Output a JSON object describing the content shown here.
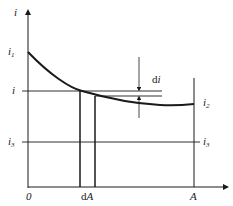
{
  "diagram": {
    "type": "line-diagram",
    "axes": {
      "y_label": "i",
      "x_label": "A",
      "origin_label": "0"
    },
    "labels": {
      "i1": {
        "base": "i",
        "sub": "1"
      },
      "i": "i",
      "i3_left": {
        "base": "i",
        "sub": "3"
      },
      "i3_right": {
        "base": "i",
        "sub": "3"
      },
      "i2": {
        "base": "i",
        "sub": "2"
      },
      "di": {
        "prefix": "d",
        "var": "i"
      },
      "dA": {
        "prefix": "d",
        "var": "A"
      },
      "A": "A"
    },
    "elements": [
      "decaying curve from i1 to i2",
      "horizontal line at i",
      "horizontal line at i3",
      "vertical strip of width dA",
      "vertical line at A",
      "di increment indicator with arrows"
    ]
  }
}
